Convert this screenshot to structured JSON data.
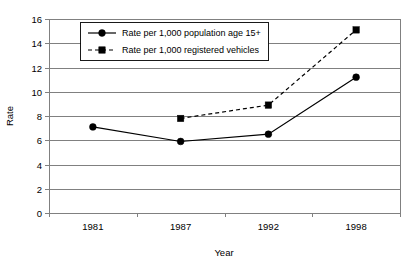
{
  "chart_data": {
    "type": "line",
    "title": "",
    "xlabel": "Year",
    "ylabel": "Rate",
    "categories": [
      "1981",
      "1987",
      "1992",
      "1998"
    ],
    "ylim": [
      0,
      16
    ],
    "ytick_step": 2,
    "yticks": [
      "0",
      "2",
      "4",
      "6",
      "8",
      "10",
      "12",
      "14",
      "16"
    ],
    "grid": true,
    "legend_position": "top-left-inside",
    "series": [
      {
        "name": "Rate per 1,000 population age 15+",
        "marker": "circle",
        "line_style": "solid",
        "color": "#000000",
        "values": [
          7.1,
          5.9,
          6.5,
          11.2
        ]
      },
      {
        "name": "Rate per 1,000 registered vehicles",
        "marker": "square",
        "line_style": "dashed",
        "color": "#000000",
        "values": [
          null,
          7.8,
          8.9,
          15.1
        ]
      }
    ]
  },
  "axes": {
    "y_title": "Rate",
    "x_title": "Year"
  },
  "legend": {
    "entries": [
      {
        "label": "Rate per 1,000 population age 15+"
      },
      {
        "label": "Rate per 1,000 registered vehicles"
      }
    ]
  }
}
